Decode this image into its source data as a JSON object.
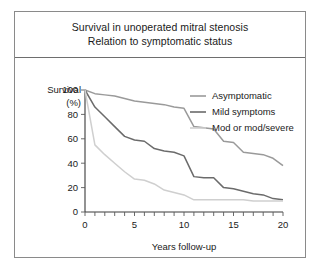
{
  "figure": {
    "background": "#ffffff",
    "frame_border_color": "#8a8a8a"
  },
  "title": {
    "line1": "Survival in unoperated mitral stenosis",
    "line2": "Relation to symptomatic status"
  },
  "axes": {
    "y_label_line1": "Survival",
    "y_label_line2": "(%)",
    "x_label": "Years follow-up",
    "y_ticks": [
      "0",
      "20",
      "40",
      "60",
      "80",
      "100"
    ],
    "x_ticks": [
      "0",
      "5",
      "10",
      "15",
      "20"
    ]
  },
  "legend": {
    "items": [
      {
        "label": "Asymptomatic",
        "color": "#9a9a9a"
      },
      {
        "label": "Mild symptoms",
        "color": "#6b6b6b"
      },
      {
        "label": "Mod or mod/severe",
        "color": "#cfcfcf"
      }
    ]
  },
  "chart_data": {
    "type": "line",
    "xlabel": "Years follow-up",
    "ylabel": "Survival (%)",
    "xlim": [
      0,
      20
    ],
    "ylim": [
      0,
      100
    ],
    "xticks": [
      0,
      1,
      2,
      3,
      4,
      5,
      6,
      7,
      8,
      9,
      10,
      11,
      12,
      13,
      14,
      15,
      16,
      17,
      18,
      19,
      20
    ],
    "xticklabels": [
      0,
      5,
      10,
      15,
      20
    ],
    "yticks": [
      0,
      20,
      40,
      60,
      80,
      100
    ],
    "grid": false,
    "legend_position": "upper right",
    "x": [
      0,
      1,
      2,
      3,
      4,
      5,
      6,
      7,
      8,
      9,
      10,
      11,
      12,
      13,
      14,
      15,
      16,
      17,
      18,
      19,
      20
    ],
    "series": [
      {
        "name": "Asymptomatic",
        "color": "#9a9a9a",
        "values": [
          100,
          97,
          96,
          95,
          93,
          91,
          90,
          89,
          88,
          86,
          85,
          70,
          69,
          68,
          58,
          57,
          49,
          48,
          47,
          44,
          38
        ]
      },
      {
        "name": "Mild symptoms",
        "color": "#6b6b6b",
        "values": [
          100,
          86,
          78,
          70,
          62,
          59,
          58,
          52,
          50,
          49,
          46,
          29,
          28,
          28,
          20,
          19,
          17,
          15,
          14,
          11,
          10
        ]
      },
      {
        "name": "Mod or mod/severe",
        "color": "#cfcfcf",
        "values": [
          100,
          55,
          47,
          40,
          33,
          27,
          26,
          23,
          18,
          16,
          14,
          10,
          10,
          10,
          10,
          10,
          10,
          9,
          9,
          9,
          9
        ]
      }
    ]
  }
}
